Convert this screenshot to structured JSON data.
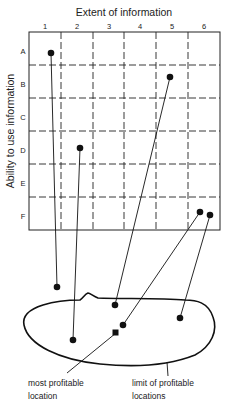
{
  "title": "Extent of information",
  "y_axis_label": "Ability to use information",
  "columns": [
    "1",
    "2",
    "3",
    "4",
    "5",
    "6"
  ],
  "rows": [
    "A",
    "B",
    "C",
    "D",
    "E",
    "F"
  ],
  "annotations": {
    "most_profitable_line1": "most profitable",
    "most_profitable_line2": "location",
    "limit_line1": "limit of profitable",
    "limit_line2": "locations"
  },
  "grid_points": [
    {
      "cell": "A1"
    },
    {
      "cell": "B5"
    },
    {
      "cell": "D2"
    },
    {
      "cell": "F6"
    },
    {
      "cell": "F6"
    }
  ],
  "colors": {
    "ink": "#111111",
    "background": "#ffffff"
  }
}
